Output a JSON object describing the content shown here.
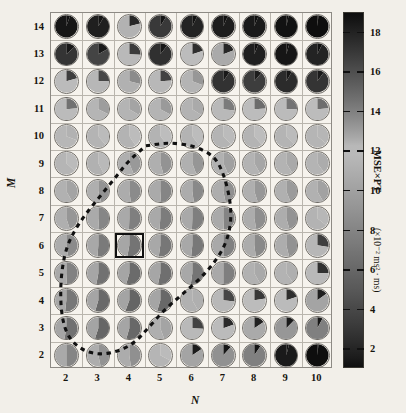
{
  "figure": {
    "type": "pie-grid-heatmap",
    "background_color": "#f2efe9"
  },
  "axes": {
    "x": {
      "label": "N",
      "ticks": [
        "2",
        "3",
        "4",
        "5",
        "6",
        "7",
        "8",
        "9",
        "10"
      ],
      "values": [
        2,
        3,
        4,
        5,
        6,
        7,
        8,
        9,
        10
      ],
      "range": [
        1.5,
        10.5
      ]
    },
    "y": {
      "label": "M",
      "ticks": [
        "14",
        "13",
        "12",
        "11",
        "10",
        "9",
        "8",
        "7",
        "6",
        "5",
        "4",
        "3",
        "2"
      ],
      "values": [
        14,
        13,
        12,
        11,
        10,
        9,
        8,
        7,
        6,
        5,
        4,
        3,
        2
      ],
      "range": [
        1.5,
        14.5
      ]
    }
  },
  "colorbar": {
    "title": "MSE×PT",
    "units_prefix": "(×10",
    "units_exponent": "-2",
    "units_suffix": " ms",
    "units_exponent2": "2",
    "units_tail": " · ms)",
    "units_full": "(×10⁻² ms² · ms)",
    "ticks": [
      "18",
      "16",
      "14",
      "12",
      "10",
      "8",
      "6",
      "4",
      "2"
    ],
    "tick_values": [
      18,
      16,
      14,
      12,
      10,
      8,
      6,
      4,
      2
    ],
    "range": [
      1,
      19
    ],
    "colors": {
      "low": "#141414",
      "mid_low": "#6f6f6f",
      "mid": "#b9b6ae",
      "mid_high": "#6a6a6a",
      "high": "#121212"
    }
  },
  "highlight": {
    "name": "optimal-parameter-cell",
    "N": 4,
    "M": 6,
    "border_color": "#111111"
  },
  "contour": {
    "name": "dashed-region-boundary",
    "style": "dashed",
    "color": "#111111",
    "description": "Closed dashed contour enclosing the low MSE×PT region"
  },
  "chart_data": {
    "type": "heatmap",
    "title": "",
    "xlabel": "N",
    "ylabel": "M",
    "legend_position": "right",
    "grid": true,
    "categories_x": [
      2,
      3,
      4,
      5,
      6,
      7,
      8,
      9,
      10
    ],
    "categories_y": [
      14,
      13,
      12,
      11,
      10,
      9,
      8,
      7,
      6,
      5,
      4,
      3,
      2
    ],
    "cell_encoding": "each cell is a two-wedge pie; wedge split angle and two gray shades encode MSE and PT",
    "value_unit": "×10⁻² ms² · ms",
    "rows": [
      {
        "M": 14,
        "cells": [
          {
            "N": 2,
            "split": 20,
            "left": 18.6,
            "right": 18.9
          },
          {
            "N": 3,
            "split": 30,
            "left": 18.2,
            "right": 18.7
          },
          {
            "N": 4,
            "split": 75,
            "left": 12.4,
            "right": 17.8
          },
          {
            "N": 5,
            "split": 32,
            "left": 17.0,
            "right": 18.6
          },
          {
            "N": 6,
            "split": 26,
            "left": 18.0,
            "right": 18.8
          },
          {
            "N": 7,
            "split": 24,
            "left": 18.3,
            "right": 18.9
          },
          {
            "N": 8,
            "split": 22,
            "left": 18.4,
            "right": 19.0
          },
          {
            "N": 9,
            "split": 12,
            "left": 18.8,
            "right": 19.0
          },
          {
            "N": 10,
            "split": 6,
            "left": 19.0,
            "right": 19.0
          }
        ]
      },
      {
        "M": 13,
        "cells": [
          {
            "N": 2,
            "split": 48,
            "left": 17.2,
            "right": 18.5
          },
          {
            "N": 3,
            "split": 60,
            "left": 16.5,
            "right": 18.4
          },
          {
            "N": 4,
            "split": 92,
            "left": 11.8,
            "right": 16.9
          },
          {
            "N": 5,
            "split": 38,
            "left": 17.4,
            "right": 18.6
          },
          {
            "N": 6,
            "split": 72,
            "left": 12.0,
            "right": 17.5
          },
          {
            "N": 7,
            "split": 68,
            "left": 12.6,
            "right": 17.8
          },
          {
            "N": 8,
            "split": 22,
            "left": 18.2,
            "right": 18.9
          },
          {
            "N": 9,
            "split": 16,
            "left": 18.6,
            "right": 19.0
          },
          {
            "N": 10,
            "split": 26,
            "left": 18.0,
            "right": 18.9
          }
        ]
      },
      {
        "M": 12,
        "cells": [
          {
            "N": 2,
            "split": 74,
            "left": 12.2,
            "right": 16.8
          },
          {
            "N": 3,
            "split": 88,
            "left": 11.6,
            "right": 16.4
          },
          {
            "N": 4,
            "split": 104,
            "left": 11.2,
            "right": 13.6
          },
          {
            "N": 5,
            "split": 86,
            "left": 11.7,
            "right": 16.6
          },
          {
            "N": 6,
            "split": 110,
            "left": 11.4,
            "right": 13.2
          },
          {
            "N": 7,
            "split": 34,
            "left": 17.3,
            "right": 18.5
          },
          {
            "N": 8,
            "split": 40,
            "left": 16.8,
            "right": 18.3
          },
          {
            "N": 9,
            "split": 30,
            "left": 17.6,
            "right": 18.6
          },
          {
            "N": 10,
            "split": 36,
            "left": 17.2,
            "right": 18.4
          }
        ]
      },
      {
        "M": 11,
        "cells": [
          {
            "N": 2,
            "split": 84,
            "left": 11.9,
            "right": 14.6
          },
          {
            "N": 3,
            "split": 116,
            "left": 11.5,
            "right": 13.0
          },
          {
            "N": 4,
            "split": 120,
            "left": 11.4,
            "right": 12.8
          },
          {
            "N": 5,
            "split": 118,
            "left": 11.4,
            "right": 13.1
          },
          {
            "N": 6,
            "split": 122,
            "left": 11.3,
            "right": 12.6
          },
          {
            "N": 7,
            "split": 96,
            "left": 11.8,
            "right": 14.2
          },
          {
            "N": 8,
            "split": 86,
            "left": 12.0,
            "right": 14.8
          },
          {
            "N": 9,
            "split": 88,
            "left": 11.9,
            "right": 14.5
          },
          {
            "N": 10,
            "split": 84,
            "left": 12.0,
            "right": 14.7
          }
        ]
      },
      {
        "M": 10,
        "cells": [
          {
            "N": 2,
            "split": 110,
            "left": 11.6,
            "right": 12.4
          },
          {
            "N": 3,
            "split": 140,
            "left": 11.4,
            "right": 12.2
          },
          {
            "N": 4,
            "split": 146,
            "left": 11.3,
            "right": 12.0
          },
          {
            "N": 5,
            "split": 140,
            "left": 11.3,
            "right": 12.1
          },
          {
            "N": 6,
            "split": 142,
            "left": 11.3,
            "right": 12.0
          },
          {
            "N": 7,
            "split": 136,
            "left": 11.4,
            "right": 12.2
          },
          {
            "N": 8,
            "split": 138,
            "left": 11.4,
            "right": 12.1
          },
          {
            "N": 9,
            "split": 134,
            "left": 11.4,
            "right": 12.2
          },
          {
            "N": 10,
            "split": 130,
            "left": 11.5,
            "right": 12.3
          }
        ]
      },
      {
        "M": 9,
        "cells": [
          {
            "N": 2,
            "split": 132,
            "left": 11.5,
            "right": 11.9
          },
          {
            "N": 3,
            "split": 152,
            "left": 11.2,
            "right": 11.8
          },
          {
            "N": 4,
            "split": 158,
            "left": 11.0,
            "right": 9.4
          },
          {
            "N": 5,
            "split": 164,
            "left": 11.0,
            "right": 9.0
          },
          {
            "N": 6,
            "split": 160,
            "left": 11.1,
            "right": 9.2
          },
          {
            "N": 7,
            "split": 156,
            "left": 11.2,
            "right": 10.0
          },
          {
            "N": 8,
            "split": 150,
            "left": 11.3,
            "right": 10.4
          },
          {
            "N": 9,
            "split": 148,
            "left": 11.3,
            "right": 10.6
          },
          {
            "N": 10,
            "split": 144,
            "left": 11.4,
            "right": 10.8
          }
        ]
      },
      {
        "M": 8,
        "cells": [
          {
            "N": 2,
            "split": 150,
            "left": 11.2,
            "right": 10.2
          },
          {
            "N": 3,
            "split": 164,
            "left": 11.0,
            "right": 9.0
          },
          {
            "N": 4,
            "split": 172,
            "left": 10.8,
            "right": 8.4
          },
          {
            "N": 5,
            "split": 176,
            "left": 10.7,
            "right": 8.0
          },
          {
            "N": 6,
            "split": 172,
            "left": 10.8,
            "right": 8.3
          },
          {
            "N": 7,
            "split": 168,
            "left": 10.9,
            "right": 8.8
          },
          {
            "N": 8,
            "split": 162,
            "left": 11.0,
            "right": 9.3
          },
          {
            "N": 9,
            "split": 158,
            "left": 11.1,
            "right": 9.6
          },
          {
            "N": 10,
            "split": 150,
            "left": 11.2,
            "right": 10.1
          }
        ]
      },
      {
        "M": 7,
        "cells": [
          {
            "N": 2,
            "split": 162,
            "left": 11.0,
            "right": 9.2
          },
          {
            "N": 3,
            "split": 176,
            "left": 10.7,
            "right": 8.1
          },
          {
            "N": 4,
            "split": 182,
            "left": 10.6,
            "right": 7.6
          },
          {
            "N": 5,
            "split": 184,
            "left": 10.6,
            "right": 7.4
          },
          {
            "N": 6,
            "split": 182,
            "left": 10.6,
            "right": 7.6
          },
          {
            "N": 7,
            "split": 178,
            "left": 10.7,
            "right": 7.9
          },
          {
            "N": 8,
            "split": 170,
            "left": 10.8,
            "right": 8.6
          },
          {
            "N": 9,
            "split": 164,
            "left": 10.9,
            "right": 9.0
          },
          {
            "N": 10,
            "split": 128,
            "left": 11.3,
            "right": 11.6
          }
        ]
      },
      {
        "M": 6,
        "cells": [
          {
            "N": 2,
            "split": 170,
            "left": 10.8,
            "right": 8.4
          },
          {
            "N": 3,
            "split": 184,
            "left": 10.5,
            "right": 7.2
          },
          {
            "N": 4,
            "split": 190,
            "left": 10.4,
            "right": 6.8
          },
          {
            "N": 5,
            "split": 188,
            "left": 10.5,
            "right": 7.0
          },
          {
            "N": 6,
            "split": 186,
            "left": 10.5,
            "right": 7.1
          },
          {
            "N": 7,
            "split": 180,
            "left": 10.6,
            "right": 7.7
          },
          {
            "N": 8,
            "split": 172,
            "left": 10.8,
            "right": 8.3
          },
          {
            "N": 9,
            "split": 166,
            "left": 10.9,
            "right": 8.9
          },
          {
            "N": 10,
            "split": 98,
            "left": 11.6,
            "right": 3.4
          }
        ]
      },
      {
        "M": 5,
        "cells": [
          {
            "N": 2,
            "split": 178,
            "left": 10.6,
            "right": 7.8
          },
          {
            "N": 3,
            "split": 190,
            "left": 10.4,
            "right": 6.6
          },
          {
            "N": 4,
            "split": 196,
            "left": 10.3,
            "right": 6.2
          },
          {
            "N": 5,
            "split": 192,
            "left": 10.4,
            "right": 6.5
          },
          {
            "N": 6,
            "split": 188,
            "left": 10.5,
            "right": 6.9
          },
          {
            "N": 7,
            "split": 180,
            "left": 10.6,
            "right": 7.6
          },
          {
            "N": 8,
            "split": 150,
            "left": 11.2,
            "right": 10.6
          },
          {
            "N": 9,
            "split": 144,
            "left": 11.3,
            "right": 11.0
          },
          {
            "N": 10,
            "split": 88,
            "left": 11.8,
            "right": 2.6
          }
        ]
      },
      {
        "M": 4,
        "cells": [
          {
            "N": 2,
            "split": 186,
            "left": 10.5,
            "right": 7.0
          },
          {
            "N": 3,
            "split": 196,
            "left": 10.3,
            "right": 6.1
          },
          {
            "N": 4,
            "split": 200,
            "left": 10.2,
            "right": 5.8
          },
          {
            "N": 5,
            "split": 196,
            "left": 10.3,
            "right": 6.0
          },
          {
            "N": 6,
            "split": 150,
            "left": 11.2,
            "right": 11.0
          },
          {
            "N": 7,
            "split": 96,
            "left": 11.7,
            "right": 3.8
          },
          {
            "N": 8,
            "split": 80,
            "left": 12.0,
            "right": 3.0
          },
          {
            "N": 9,
            "split": 72,
            "left": 12.2,
            "right": 2.4
          },
          {
            "N": 10,
            "split": 54,
            "left": 12.8,
            "right": 1.6
          }
        ]
      },
      {
        "M": 3,
        "cells": [
          {
            "N": 2,
            "split": 190,
            "left": 10.4,
            "right": 6.6
          },
          {
            "N": 3,
            "split": 198,
            "left": 10.2,
            "right": 5.9
          },
          {
            "N": 4,
            "split": 196,
            "left": 10.3,
            "right": 6.0
          },
          {
            "N": 5,
            "split": 160,
            "left": 11.0,
            "right": 10.2
          },
          {
            "N": 6,
            "split": 92,
            "left": 11.8,
            "right": 3.6
          },
          {
            "N": 7,
            "split": 70,
            "left": 12.2,
            "right": 2.2
          },
          {
            "N": 8,
            "split": 56,
            "left": 12.6,
            "right": 1.7
          },
          {
            "N": 9,
            "split": 44,
            "left": 13.2,
            "right": 1.4
          },
          {
            "N": 10,
            "split": 28,
            "left": 14.0,
            "right": 1.2
          }
        ]
      },
      {
        "M": 2,
        "cells": [
          {
            "N": 2,
            "split": 180,
            "left": 10.6,
            "right": 8.0
          },
          {
            "N": 3,
            "split": 168,
            "left": 10.9,
            "right": 9.0
          },
          {
            "N": 4,
            "split": 172,
            "left": 10.8,
            "right": 8.8
          },
          {
            "N": 5,
            "split": 118,
            "left": 11.5,
            "right": 11.9
          },
          {
            "N": 6,
            "split": 56,
            "left": 12.8,
            "right": 1.5
          },
          {
            "N": 7,
            "split": 42,
            "left": 13.4,
            "right": 1.3
          },
          {
            "N": 8,
            "split": 34,
            "left": 14.0,
            "right": 1.2
          },
          {
            "N": 9,
            "split": 14,
            "left": 18.4,
            "right": 1.1
          },
          {
            "N": 10,
            "split": 6,
            "left": 19.0,
            "right": 1.0
          }
        ]
      }
    ]
  }
}
